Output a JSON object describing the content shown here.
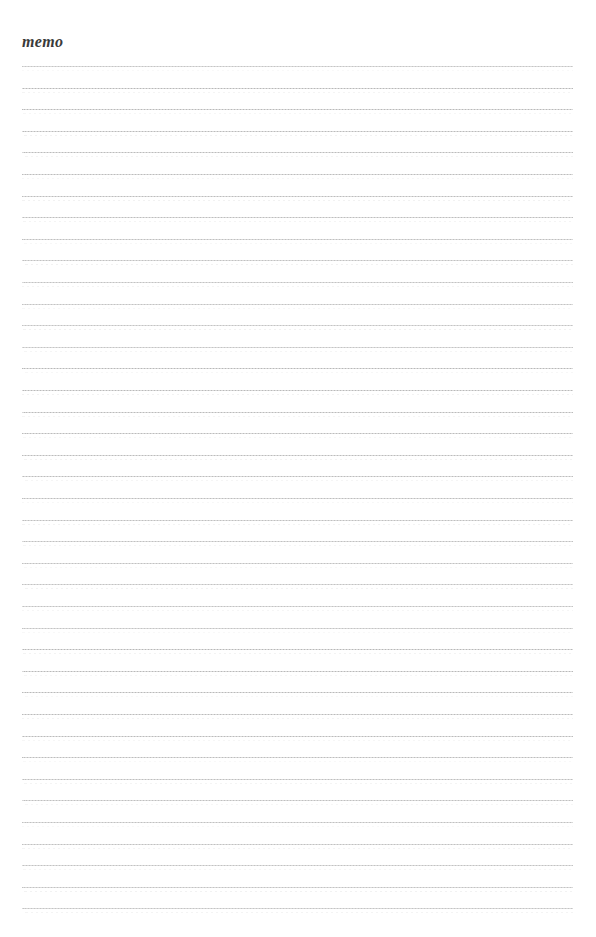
{
  "page": {
    "title": "memo",
    "background_color": "#ffffff",
    "width": 596,
    "height": 937
  },
  "title_block": {
    "label": "memo",
    "color": "#3a3a3a",
    "left": 22,
    "top": 33
  },
  "ruled_lines": {
    "count": 40,
    "first_line_y": 66,
    "spacing": 21.6,
    "left": 22,
    "right": 573,
    "width": 551,
    "color": "#d9d9d9",
    "dot_color": "#b5b5b5",
    "shadow_color": "#ececec"
  },
  "notes": {
    "content_lines": [
      "",
      "",
      "",
      "",
      "",
      "",
      "",
      "",
      "",
      "",
      "",
      "",
      "",
      "",
      "",
      "",
      "",
      "",
      "",
      "",
      "",
      "",
      "",
      "",
      "",
      "",
      "",
      "",
      "",
      "",
      "",
      "",
      "",
      "",
      "",
      "",
      "",
      "",
      "",
      ""
    ]
  }
}
